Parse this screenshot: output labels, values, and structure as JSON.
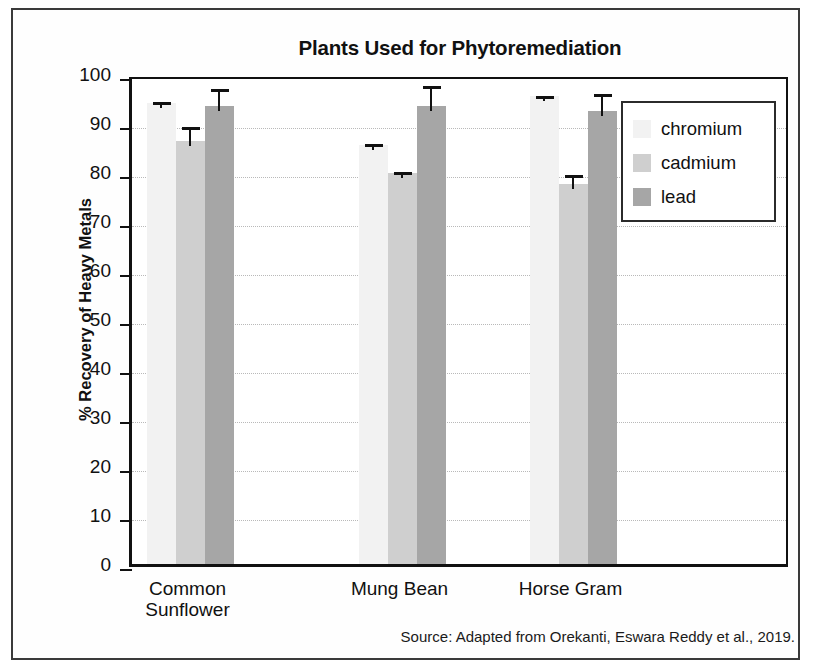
{
  "figure": {
    "title": "Plants Used for Phytoremediation",
    "y_axis_title": "% Recovery of Heavy Metals",
    "source_note": "Source: Adapted from Orekanti, Eswara Reddy et al., 2019."
  },
  "legend": {
    "items": [
      {
        "label": "chromium",
        "color": "#f2f2f2"
      },
      {
        "label": "cadmium",
        "color": "#cfcfcf"
      },
      {
        "label": "lead",
        "color": "#a6a6a6"
      }
    ]
  },
  "y_ticks": [
    "0",
    "10",
    "20",
    "30",
    "40",
    "50",
    "60",
    "70",
    "80",
    "90",
    "100"
  ],
  "x_labels": [
    "Common\nSunflower",
    "Mung Bean",
    "Horse Gram"
  ],
  "chart_data": {
    "type": "bar",
    "title": "Plants Used for Phytoremediation",
    "xlabel": "",
    "ylabel": "% Recovery of Heavy Metals",
    "ylim": [
      0,
      100
    ],
    "ytick_step": 10,
    "grid": true,
    "legend_position": "upper right inside plot",
    "categories": [
      "Common Sunflower",
      "Mung Bean",
      "Horse Gram"
    ],
    "series": [
      {
        "name": "chromium",
        "color": "#f2f2f2",
        "values": [
          94.0,
          85.5,
          95.5
        ],
        "errors": [
          1.3,
          1.2,
          1.0
        ]
      },
      {
        "name": "cadmium",
        "color": "#cfcfcf",
        "values": [
          86.3,
          79.8,
          77.5
        ],
        "errors": [
          4.0,
          1.3,
          3.0
        ]
      },
      {
        "name": "lead",
        "color": "#a6a6a6",
        "values": [
          93.5,
          93.5,
          92.5
        ],
        "errors": [
          4.5,
          5.0,
          4.5
        ]
      }
    ],
    "annotations": [
      "Source: Adapted from Orekanti, Eswara Reddy et al., 2019."
    ]
  }
}
